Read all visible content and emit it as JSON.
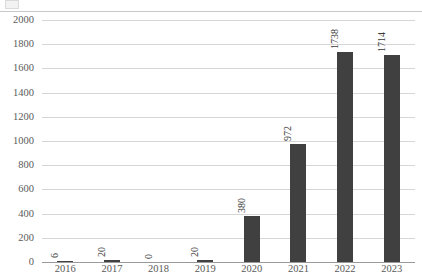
{
  "chart_data": {
    "type": "bar",
    "title": "",
    "xlabel": "",
    "ylabel": "",
    "categories": [
      "2016",
      "2017",
      "2018",
      "2019",
      "2020",
      "2021",
      "2022",
      "2023"
    ],
    "values": [
      6,
      20,
      0,
      20,
      380,
      972,
      1738,
      1714
    ],
    "data_labels": [
      "6",
      "20",
      "0",
      "20",
      "380",
      "972",
      "1738",
      "1714"
    ],
    "data_label_rotation": -90,
    "ylim": [
      0,
      2000
    ],
    "ytick_step": 200,
    "yticks": [
      "0",
      "200",
      "400",
      "600",
      "800",
      "1000",
      "1200",
      "1400",
      "1600",
      "1800",
      "2000"
    ],
    "grid": true,
    "legend": null,
    "bar_color": "#404040",
    "gridline_color": "#d6d6d6",
    "axis_color": "#9a9a9a",
    "tick_text_color": "#5a5a5a"
  }
}
